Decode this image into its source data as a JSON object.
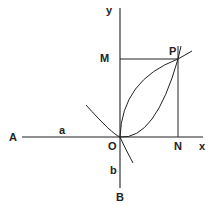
{
  "diagram": {
    "labels": {
      "y_axis": "y",
      "x_axis": "x",
      "M": "M",
      "P": "P",
      "A": "A",
      "a": "a",
      "O": "O",
      "N": "N",
      "b": "b",
      "B": "B"
    },
    "colors": {
      "ink": "#222222",
      "background": "#ffffff"
    }
  }
}
